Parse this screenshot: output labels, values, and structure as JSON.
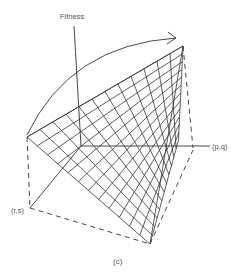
{
  "figure": {
    "labels": {
      "fitness": "Fitness",
      "pq": "(p,q)",
      "rs": "(r,s)",
      "caption": "(c)"
    },
    "colors": {
      "line": "#333333",
      "text": "#555555",
      "background": "#ffffff"
    },
    "points": {
      "apex": [
        183,
        46
      ],
      "left": [
        27,
        137
      ],
      "origin": [
        81,
        146
      ],
      "bottom": [
        150,
        244
      ],
      "rs_corner": [
        30,
        208
      ],
      "pq_end": [
        210,
        146
      ],
      "right_corner": [
        193,
        148
      ]
    }
  }
}
